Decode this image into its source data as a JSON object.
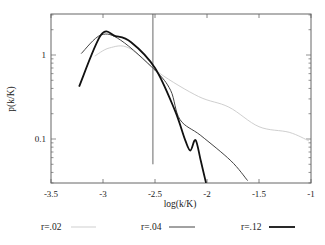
{
  "chart_data": {
    "type": "line",
    "title": "",
    "xlabel": "log(k/K)",
    "ylabel": "p(k/K)",
    "xlim": [
      -3.5,
      -1
    ],
    "ylim": [
      0.03,
      3.1
    ],
    "yscale": "log",
    "grid": false,
    "legend_position": "bottom",
    "x_ticks": [
      "-3.5",
      "-3",
      "-2.5",
      "-2",
      "-1.5",
      "-1"
    ],
    "y_ticks": [
      "1",
      "0.1"
    ],
    "annotations": [
      {
        "type": "vertical-line",
        "x": -2.52,
        "y_from": 0.05,
        "y_to": 3.1
      }
    ],
    "series": [
      {
        "name": "r=.02",
        "color": "#cfcfcf",
        "width": 1,
        "x": [
          -3.08,
          -2.94,
          -2.75,
          -2.46,
          -2.08,
          -1.79,
          -1.5,
          -1.21,
          -1.02
        ],
        "y": [
          0.97,
          1.21,
          1.21,
          0.61,
          0.32,
          0.24,
          0.14,
          0.12,
          0.095
        ]
      },
      {
        "name": "r=.04",
        "color": "#444444",
        "width": 1,
        "x": [
          -3.21,
          -3.02,
          -2.83,
          -2.5,
          -2.35,
          -2.26,
          -2.06,
          -1.77,
          -1.61
        ],
        "y": [
          1.04,
          1.73,
          1.5,
          0.66,
          0.38,
          0.17,
          0.11,
          0.055,
          0.032
        ]
      },
      {
        "name": "r=.12",
        "color": "#111111",
        "width": 1.8,
        "x": [
          -3.23,
          -3.02,
          -2.88,
          -2.73,
          -2.5,
          -2.31,
          -2.21,
          -2.16,
          -2.11,
          -2.06,
          -2.01
        ],
        "y": [
          0.42,
          1.73,
          1.68,
          1.42,
          0.7,
          0.22,
          0.097,
          0.073,
          0.097,
          0.055,
          0.03
        ]
      }
    ]
  },
  "legend": [
    {
      "label": "r=.02"
    },
    {
      "label": "r=.04"
    },
    {
      "label": "r=.12"
    }
  ]
}
